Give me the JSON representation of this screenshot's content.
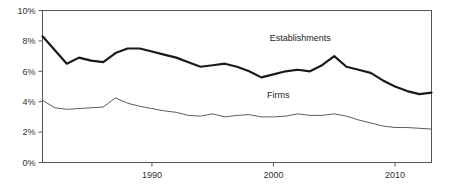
{
  "chart_data": {
    "type": "line",
    "title": "",
    "subtitle": "",
    "xlabel": "",
    "ylabel": "",
    "xlim": [
      1981,
      2013
    ],
    "ylim": [
      0,
      10
    ],
    "grid": false,
    "legend_position": "inline-annotations",
    "y_ticks": [
      0,
      2,
      4,
      6,
      8,
      10
    ],
    "y_tick_labels": [
      "0%",
      "2%",
      "4%",
      "6%",
      "8%",
      "10%"
    ],
    "x_ticks": [
      1990,
      2000,
      2010
    ],
    "x_tick_labels": [
      "1990",
      "2000",
      "2010"
    ],
    "x": [
      1981,
      1982,
      1983,
      1984,
      1985,
      1986,
      1987,
      1988,
      1989,
      1990,
      1991,
      1992,
      1993,
      1994,
      1995,
      1996,
      1997,
      1998,
      1999,
      2000,
      2001,
      2002,
      2003,
      2004,
      2005,
      2006,
      2007,
      2008,
      2009,
      2010,
      2011,
      2012,
      2013
    ],
    "series": [
      {
        "name": "Establishments",
        "color": "#1a1a1a",
        "line_width": 2.2,
        "label_x": 2002.2,
        "label_y": 8.0,
        "values": [
          8.3,
          7.4,
          6.5,
          6.9,
          6.7,
          6.6,
          7.2,
          7.5,
          7.5,
          7.3,
          7.1,
          6.9,
          6.6,
          6.3,
          6.4,
          6.5,
          6.3,
          6.0,
          5.6,
          5.8,
          6.0,
          6.1,
          6.0,
          6.4,
          7.0,
          6.3,
          6.1,
          5.9,
          5.4,
          5.0,
          4.7,
          4.5,
          4.6
        ]
      },
      {
        "name": "Firms",
        "color": "#4a4a4a",
        "line_width": 0.9,
        "label_x": 2000.4,
        "label_y": 4.25,
        "values": [
          4.1,
          3.6,
          3.5,
          3.55,
          3.6,
          3.65,
          4.25,
          3.9,
          3.7,
          3.55,
          3.4,
          3.3,
          3.1,
          3.05,
          3.2,
          3.0,
          3.1,
          3.15,
          3.0,
          3.0,
          3.05,
          3.2,
          3.1,
          3.1,
          3.2,
          3.05,
          2.8,
          2.6,
          2.4,
          2.3,
          2.3,
          2.25,
          2.2
        ]
      }
    ]
  },
  "axes": {
    "frame_color": "#555555",
    "tick_color": "#555555"
  }
}
